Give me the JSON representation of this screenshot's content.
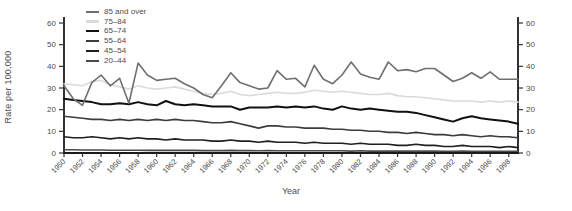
{
  "chart_data": {
    "type": "line",
    "title": "",
    "xlabel": "Year",
    "ylabel": "Rate per 100,000",
    "ylim": [
      0,
      60
    ],
    "yticks": [
      0,
      10,
      20,
      30,
      40,
      50,
      60
    ],
    "xticks": [
      1950,
      1952,
      1954,
      1956,
      1958,
      1960,
      1962,
      1964,
      1966,
      1968,
      1970,
      1972,
      1974,
      1976,
      1978,
      1980,
      1982,
      1984,
      1986,
      1988,
      1990,
      1992,
      1994,
      1996,
      1998
    ],
    "x": [
      1950,
      1951,
      1952,
      1953,
      1954,
      1955,
      1956,
      1957,
      1958,
      1959,
      1960,
      1961,
      1962,
      1963,
      1964,
      1965,
      1966,
      1967,
      1968,
      1969,
      1970,
      1971,
      1972,
      1973,
      1974,
      1975,
      1976,
      1977,
      1978,
      1979,
      1980,
      1981,
      1982,
      1983,
      1984,
      1985,
      1986,
      1987,
      1988,
      1989,
      1990,
      1991,
      1992,
      1993,
      1994,
      1995,
      1996,
      1997,
      1998,
      1999
    ],
    "grid": false,
    "legend_position": "top-left",
    "axes": {
      "left": true,
      "right": true,
      "bottom": true,
      "right_tick_labels": true
    },
    "series": [
      {
        "name": "85 and over",
        "color": "#6f6f6f",
        "width": 1.6,
        "values": [
          31,
          25,
          22,
          32.5,
          36,
          31,
          34.5,
          23,
          41.5,
          36,
          33.5,
          34,
          34.5,
          32,
          30,
          27,
          25.5,
          31,
          37,
          32.5,
          31,
          29.5,
          30,
          38,
          34,
          34.5,
          30.5,
          40.5,
          34,
          32,
          36,
          42,
          36.5,
          35,
          34,
          42,
          38,
          38.5,
          37.5,
          39,
          39,
          36,
          33,
          34.5,
          37,
          34.5,
          37.5,
          34,
          34,
          34
        ]
      },
      {
        "name": "75–84",
        "color": "#dbdbdb",
        "width": 1.6,
        "values": [
          32,
          31.5,
          31,
          33,
          33.5,
          31.5,
          30.5,
          29.5,
          31,
          30,
          29.5,
          30,
          30.5,
          29.5,
          28.5,
          27.5,
          27,
          27.5,
          28.5,
          27,
          26.5,
          27,
          27.5,
          28,
          27.5,
          27.5,
          28,
          29,
          28.5,
          28,
          28.5,
          28,
          27.5,
          27,
          27,
          27.5,
          26.5,
          26,
          26,
          25.5,
          25,
          24.5,
          24,
          24,
          24,
          23.5,
          24,
          23.5,
          24,
          23.5
        ]
      },
      {
        "name": "65–74",
        "color": "#111111",
        "width": 2.0,
        "values": [
          25,
          24.5,
          24,
          23.5,
          22.5,
          22.5,
          23,
          22.5,
          23.5,
          22.5,
          22,
          24,
          22.5,
          22,
          22.5,
          22,
          21.5,
          21.5,
          21.5,
          20,
          21,
          21,
          21,
          21.5,
          21,
          21.5,
          21,
          21.5,
          20.5,
          20,
          21.5,
          20.5,
          20,
          20.5,
          20,
          19.5,
          19,
          19,
          18.5,
          17.5,
          16.5,
          15.5,
          14.5,
          16,
          17,
          16,
          15.5,
          15,
          14.5,
          13.5
        ]
      },
      {
        "name": "55–64",
        "color": "#3c3c3c",
        "width": 1.6,
        "values": [
          17,
          16.5,
          16,
          15.5,
          15.5,
          15,
          15.5,
          15,
          15.5,
          15,
          15.5,
          15,
          15.5,
          15,
          15,
          14.5,
          14,
          14,
          14.5,
          13.5,
          12.5,
          11.5,
          12.5,
          12.5,
          12,
          12,
          11.5,
          11.5,
          11.5,
          11,
          11,
          10.5,
          10.5,
          10,
          10,
          9.5,
          9.5,
          9,
          9.5,
          9,
          8.5,
          8.5,
          8,
          8.5,
          8,
          7.5,
          8,
          7.5,
          7.5,
          7
        ]
      },
      {
        "name": "45–54",
        "color": "#1f1f1f",
        "width": 1.6,
        "values": [
          7.5,
          7,
          7,
          7.5,
          7,
          6.5,
          7,
          6.5,
          7,
          6.5,
          6.5,
          6,
          6.5,
          6,
          6,
          6,
          5.5,
          5.5,
          6,
          5.5,
          5.5,
          5,
          5.5,
          5,
          5,
          5,
          4.5,
          5,
          4.5,
          4.5,
          4.5,
          4,
          4.5,
          4,
          4,
          4,
          3.5,
          3.5,
          4,
          3.5,
          3.5,
          3,
          3,
          3.5,
          3,
          3,
          3,
          2.5,
          3,
          2.5
        ]
      },
      {
        "name": "20–44",
        "color": "#4a4a4a",
        "width": 1.6,
        "values": [
          1.5,
          1.5,
          1.4,
          1.4,
          1.4,
          1.3,
          1.3,
          1.3,
          1.3,
          1.2,
          1.2,
          1.2,
          1.2,
          1.2,
          1.2,
          1.1,
          1.1,
          1.1,
          1.2,
          1.1,
          1.1,
          1.0,
          1.1,
          1.0,
          1.0,
          1.0,
          1.0,
          1.0,
          1.0,
          1.0,
          1.0,
          0.9,
          1.0,
          0.9,
          0.9,
          0.9,
          0.9,
          0.9,
          0.9,
          0.9,
          0.9,
          0.8,
          0.8,
          0.9,
          0.8,
          0.8,
          0.8,
          0.8,
          0.8,
          0.8
        ]
      }
    ],
    "style": {
      "axis_color": "#1a1a1a",
      "tick_color": "#333333",
      "tick_label_color": "#4d4d4d",
      "background": "#ffffff"
    }
  }
}
